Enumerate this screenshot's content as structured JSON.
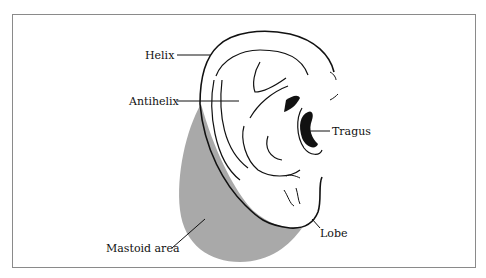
{
  "figure": {
    "colors": {
      "mastoid_fill": "#a9a9a9",
      "ink": "#111111",
      "frame": "#8a8a8a"
    },
    "labels": {
      "helix": "Helix",
      "antihelix": "Antihelix",
      "tragus": "Tragus",
      "lobe": "Lobe",
      "mastoid_area": "Mastoid area"
    }
  }
}
